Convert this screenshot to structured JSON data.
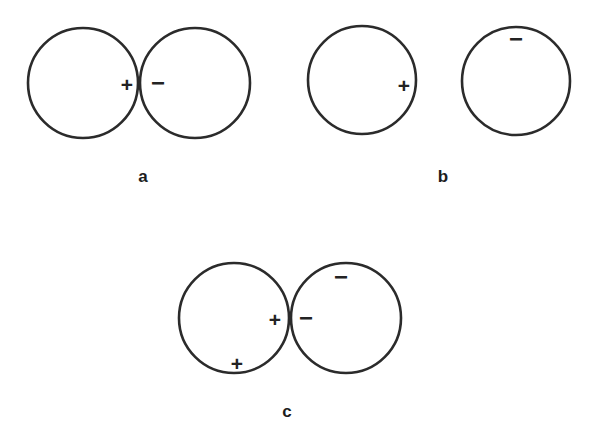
{
  "figure": {
    "background_color": "#ffffff",
    "stroke_color": "#2b2b2b",
    "symbol_color": "#232323",
    "label_color": "#1d1d1d",
    "width": 599,
    "height": 433,
    "panels": [
      {
        "id": "a",
        "label": "a",
        "label_x": 143,
        "label_y": 176,
        "description": "two tangent circles with plus and minus at contact point",
        "circles": [
          {
            "name": "left-circle",
            "cx": 83,
            "cy": 83,
            "r": 55
          },
          {
            "name": "right-circle",
            "cx": 195,
            "cy": 83,
            "r": 55
          }
        ],
        "symbols": [
          {
            "name": "plus-sign",
            "glyph": "+",
            "x": 127,
            "y": 84
          },
          {
            "name": "minus-sign",
            "glyph": "−",
            "x": 158,
            "y": 82
          }
        ]
      },
      {
        "id": "b",
        "label": "b",
        "label_x": 443,
        "label_y": 176,
        "description": "two separated circles, plus inside right edge of left circle, minus inside top of right circle",
        "circles": [
          {
            "name": "left-circle",
            "cx": 362,
            "cy": 80,
            "r": 54
          },
          {
            "name": "right-circle",
            "cx": 516,
            "cy": 81,
            "r": 54
          }
        ],
        "symbols": [
          {
            "name": "plus-sign",
            "glyph": "+",
            "x": 404,
            "y": 85
          },
          {
            "name": "minus-sign",
            "glyph": "−",
            "x": 516,
            "y": 38
          }
        ]
      },
      {
        "id": "c",
        "label": "c",
        "label_x": 287,
        "label_y": 411,
        "description": "two tangent circles with plus and minus at contact point, extra plus on lower left circle and extra minus on upper right circle",
        "circles": [
          {
            "name": "left-circle",
            "cx": 234,
            "cy": 318,
            "r": 55
          },
          {
            "name": "right-circle",
            "cx": 346,
            "cy": 318,
            "r": 55
          }
        ],
        "symbols": [
          {
            "name": "plus-sign-contact",
            "glyph": "+",
            "x": 275,
            "y": 319
          },
          {
            "name": "minus-sign-contact",
            "glyph": "−",
            "x": 306,
            "y": 317
          },
          {
            "name": "plus-sign-lower-left",
            "glyph": "+",
            "x": 237,
            "y": 363
          },
          {
            "name": "minus-sign-upper-right",
            "glyph": "−",
            "x": 341,
            "y": 276
          }
        ]
      }
    ]
  }
}
